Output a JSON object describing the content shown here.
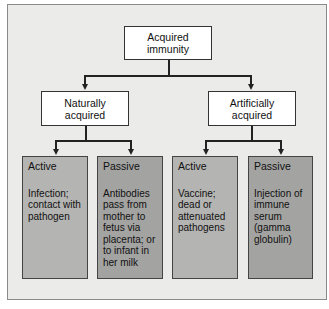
{
  "diagram": {
    "root": {
      "line1": "Acquired",
      "line2": "immunity"
    },
    "branches": [
      {
        "line1": "Naturally",
        "line2": "acquired"
      },
      {
        "line1": "Artificially",
        "line2": "acquired"
      }
    ],
    "leaves": [
      {
        "type": "Active",
        "text": "Infection; contact with pathogen"
      },
      {
        "type": "Passive",
        "text": "Antibodies pass from mother to fetus via placenta; or to infant in her milk"
      },
      {
        "type": "Active",
        "text": "Vaccine; dead or attenuated pathogens"
      },
      {
        "type": "Passive",
        "text": "Injection of immune serum (gamma globulin)"
      }
    ]
  }
}
